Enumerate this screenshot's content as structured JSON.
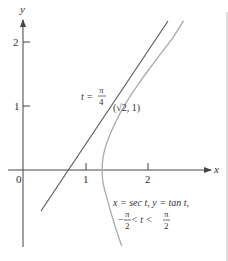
{
  "figure": {
    "axes": {
      "x_label": "x",
      "y_label": "y",
      "origin_label": "0",
      "x_ticks": [
        {
          "value": 1,
          "label": "1"
        },
        {
          "value": 2,
          "label": "2"
        }
      ],
      "y_ticks": [
        {
          "value": 1,
          "label": "1"
        },
        {
          "value": 2,
          "label": "2"
        }
      ]
    },
    "curve": {
      "name": "hyperbola-branch",
      "equation_line1": "x = sec t,  y = tan t,",
      "equation_line2_left": "−",
      "equation_line2_mid": " < t < ",
      "pi": "π",
      "two": "2",
      "color": "#aaaaaa"
    },
    "tangent": {
      "point_label": "(√2, 1)",
      "param_label_t": "t =",
      "param_label_num": "π",
      "param_label_den": "4",
      "slope": "√2",
      "color": "#555555"
    },
    "colors": {
      "axis": "#444444",
      "border": "#bbbbbb",
      "text": "#333333"
    }
  }
}
